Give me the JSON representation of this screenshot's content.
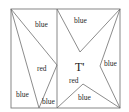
{
  "diagram": {
    "title_label": "T'",
    "left_panel": {
      "regions": [
        {
          "id": "top-right-triangle",
          "label": "blue"
        },
        {
          "id": "middle-triangle",
          "label": "red"
        },
        {
          "id": "bottom-left-triangle",
          "label": "blue"
        },
        {
          "id": "bottom-small-triangle",
          "label": "blue"
        }
      ]
    },
    "right_panel": {
      "regions": [
        {
          "id": "top-triangle",
          "label": "blue"
        },
        {
          "id": "right-triangle",
          "label": "blue"
        },
        {
          "id": "bottom-triangle",
          "label": "blue"
        },
        {
          "id": "center-region",
          "label": "red"
        }
      ]
    },
    "colors": {
      "line": "#6e6e6e",
      "text": "#2a2a2a",
      "background": "#ffffff"
    }
  }
}
